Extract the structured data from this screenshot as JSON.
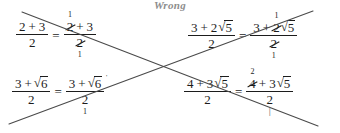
{
  "page": {
    "title": "Wrong",
    "width": 340,
    "height": 133,
    "background": "#ffffff",
    "ink_color": "#1c1c1c",
    "title_color": "#8d8d8d"
  },
  "annotation": {
    "kind": "cross-out",
    "description": "large X drawn over all four equations",
    "color": "#4a4a4a",
    "line1_label": "diagonal-down",
    "line2_label": "diagonal-up"
  },
  "equations": [
    {
      "id": "eq1",
      "left": {
        "numerator": [
          "2",
          "+",
          "3"
        ],
        "denominator": [
          "2"
        ]
      },
      "relation": "=",
      "right": {
        "numerator_tokens": [
          {
            "text": "2",
            "cancelled": true,
            "replacement": "1",
            "replacement_pos": "above"
          },
          {
            "text": "+",
            "cancelled": false
          },
          {
            "text": "3",
            "cancelled": false
          }
        ],
        "denominator_tokens": [
          {
            "text": "2",
            "cancelled": true,
            "replacement": "1",
            "replacement_pos": "below"
          }
        ]
      }
    },
    {
      "id": "eq2",
      "left": {
        "numerator": [
          "3",
          "+",
          "2",
          "√5"
        ],
        "denominator": [
          "2"
        ]
      },
      "relation": "=",
      "right": {
        "numerator_tokens": [
          {
            "text": "3",
            "cancelled": false
          },
          {
            "text": "+",
            "cancelled": false
          },
          {
            "text": "2",
            "cancelled": true,
            "replacement": "1",
            "replacement_pos": "above"
          },
          {
            "text": "√5",
            "cancelled": false
          }
        ],
        "denominator_tokens": [
          {
            "text": "2",
            "cancelled": true,
            "replacement": "1",
            "replacement_pos": "below"
          }
        ]
      }
    },
    {
      "id": "eq3",
      "left": {
        "numerator": [
          "3",
          "+",
          "√6"
        ],
        "denominator": [
          "2"
        ]
      },
      "relation": "=",
      "right": {
        "numerator_tokens": [
          {
            "text": "3",
            "cancelled": false
          },
          {
            "text": "+",
            "cancelled": false
          },
          {
            "text": "√6",
            "cancelled": false,
            "stray_mark": "'"
          }
        ],
        "denominator_tokens": [
          {
            "text": "2",
            "cancelled": false,
            "replacement": "1",
            "replacement_pos": "below"
          }
        ]
      }
    },
    {
      "id": "eq4",
      "left": {
        "numerator": [
          "4",
          "+",
          "3",
          "√5"
        ],
        "denominator": [
          "2"
        ]
      },
      "relation": "=",
      "right": {
        "numerator_tokens": [
          {
            "text": "4",
            "cancelled": true,
            "replacement": "2",
            "replacement_pos": "above"
          },
          {
            "text": "+",
            "cancelled": false
          },
          {
            "text": "3",
            "cancelled": false
          },
          {
            "text": "√5",
            "cancelled": false
          }
        ],
        "denominator_tokens": [
          {
            "text": "2",
            "cancelled": false,
            "replacement": "|",
            "replacement_pos": "below"
          }
        ]
      }
    }
  ],
  "symbols": {
    "radical": "√",
    "equals": "=",
    "plus": "+"
  }
}
